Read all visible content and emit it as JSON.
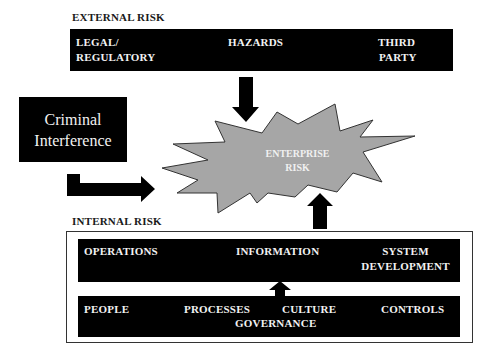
{
  "diagram": {
    "external": {
      "heading": "EXTERNAL RISK",
      "items": [
        {
          "line1": "LEGAL/",
          "line2": "REGULATORY"
        },
        {
          "line1": "HAZARDS",
          "line2": ""
        },
        {
          "line1": "THIRD",
          "line2": "PARTY"
        }
      ]
    },
    "criminal": {
      "line1": "Criminal",
      "line2": "Interference"
    },
    "center": {
      "line1": "ENTERPRISE",
      "line2": "RISK",
      "fill": "#a6a6a6"
    },
    "internal": {
      "heading": "INTERNAL RISK",
      "top_row": [
        {
          "line1": "OPERATIONS",
          "line2": ""
        },
        {
          "line1": "INFORMATION",
          "line2": ""
        },
        {
          "line1": "SYSTEM",
          "line2": "DEVELOPMENT"
        }
      ],
      "bottom_row": {
        "people": "PEOPLE",
        "processes": "PROCESSES",
        "culture": "CULTURE",
        "controls": "CONTROLS",
        "governance": "GOVERNANCE"
      }
    },
    "colors": {
      "box": "#000000",
      "box_text": "#f2f2f2",
      "star": "#a6a6a6",
      "star_outline": "#333333"
    }
  }
}
